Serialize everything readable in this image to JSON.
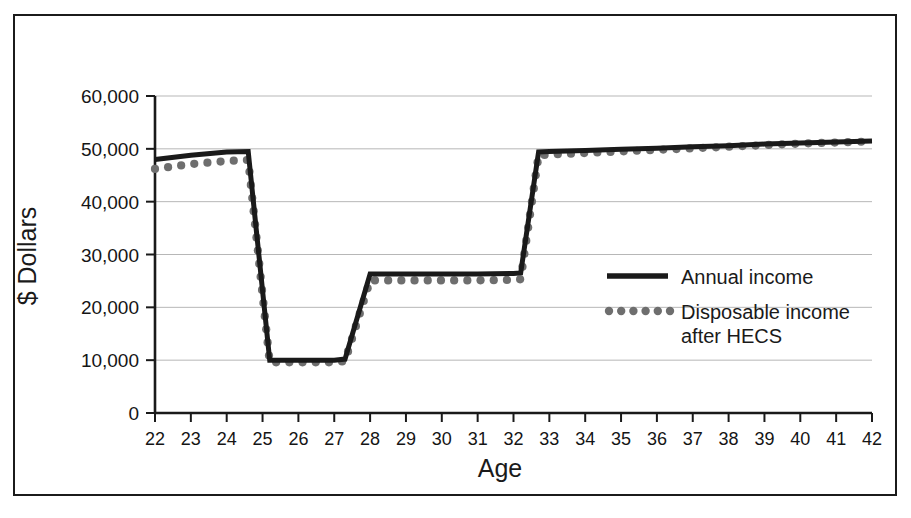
{
  "figure": {
    "background": "#ffffff",
    "frame_color": "#1b1b1b"
  },
  "axis": {
    "x_title": "Age",
    "y_title": "$ Dollars",
    "y_ticks": [
      "0",
      "10,000",
      "20,000",
      "30,000",
      "40,000",
      "50,000",
      "60,000"
    ],
    "x_ticks": [
      "22",
      "23",
      "24",
      "25",
      "26",
      "27",
      "28",
      "29",
      "30",
      "31",
      "32",
      "33",
      "34",
      "35",
      "36",
      "37",
      "38",
      "39",
      "40",
      "41",
      "42"
    ]
  },
  "legend": {
    "items": [
      {
        "label": "Annual income",
        "style": "solid-line",
        "color": "#1a1a1a"
      },
      {
        "label": "Disposable income",
        "label2": "after HECS",
        "style": "dotted-line",
        "color": "#6e6e6e"
      }
    ]
  },
  "chart_data": {
    "type": "line",
    "title": "",
    "subtitle": "",
    "xlabel": "Age",
    "ylabel": "$ Dollars",
    "xlim": [
      22,
      42
    ],
    "ylim": [
      0,
      60000
    ],
    "ytick_values": [
      0,
      10000,
      20000,
      30000,
      40000,
      50000,
      60000
    ],
    "grid": "horizontal",
    "legend_position": "right-middle",
    "x": [
      22,
      23,
      24,
      24.6,
      25.2,
      26,
      27,
      27.3,
      28,
      29,
      30,
      31,
      32,
      32.2,
      32.7,
      33,
      34,
      35,
      36,
      37,
      38,
      39,
      40,
      41,
      42
    ],
    "series": [
      {
        "name": "Annual income",
        "style": "solid-line",
        "color": "#1a1a1a",
        "values": [
          48000,
          48800,
          49400,
          49500,
          10000,
          10000,
          10000,
          10200,
          26300,
          26300,
          26300,
          26300,
          26400,
          26500,
          49400,
          49500,
          49700,
          49900,
          50100,
          50400,
          50600,
          50900,
          51100,
          51300,
          51500
        ]
      },
      {
        "name": "Disposable income after HECS",
        "style": "dotted-line",
        "color": "#6e6e6e",
        "values": [
          46200,
          47100,
          47700,
          47900,
          9600,
          9600,
          9600,
          9800,
          25100,
          25100,
          25100,
          25100,
          25200,
          25300,
          48800,
          48900,
          49200,
          49500,
          49800,
          50100,
          50400,
          50700,
          51000,
          51200,
          51400
        ]
      }
    ]
  }
}
